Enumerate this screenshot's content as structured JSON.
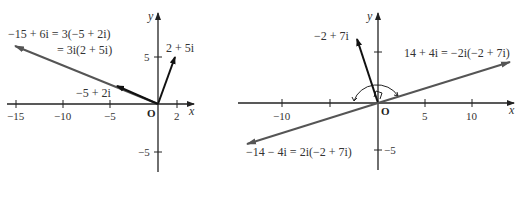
{
  "left_diagram": {
    "axis_labels": {
      "x": "x",
      "y": "y"
    },
    "origin_label": "O",
    "x_ticks": [
      "−15",
      "−10",
      "−5",
      "2"
    ],
    "y_ticks": [
      "5",
      "−5"
    ],
    "vectors": [
      {
        "label": "2 + 5i",
        "re": 2,
        "im": 5
      },
      {
        "label": "−5 + 2i",
        "re": -5,
        "im": 2
      },
      {
        "label_line1": "−15 + 6i = 3(−5 + 2i)",
        "label_line2": "= 3i(2 + 5i)",
        "re": -15,
        "im": 6
      }
    ]
  },
  "right_diagram": {
    "axis_labels": {
      "x": "x",
      "y": "y"
    },
    "origin_label": "O",
    "x_ticks": [
      "−10",
      "5",
      "10"
    ],
    "y_ticks": [
      "−5"
    ],
    "vectors": [
      {
        "label": "−2 + 7i",
        "re": -2,
        "im": 7
      },
      {
        "label": "14 + 4i = −2i(−2 + 7i)",
        "re": 14,
        "im": 4
      },
      {
        "label": "−14 − 4i = 2i(−2 + 7i)",
        "re": -14,
        "im": -4
      }
    ]
  },
  "colors": {
    "axis": "#222222",
    "vector_dark": "#111111",
    "vector_gray": "#555555",
    "text": "#333333"
  }
}
